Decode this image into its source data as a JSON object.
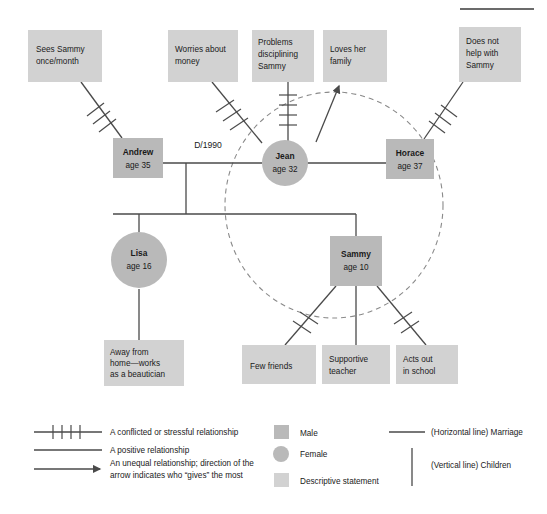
{
  "figure": {
    "title": "",
    "background_color": "#ffffff"
  },
  "colors": {
    "male_fill": "#b9b9b9",
    "female_fill": "#b9b9b9",
    "descriptive_fill": "#d2d2d2",
    "line": "#4a4a4a",
    "dashed_boundary": "#8a8a8a",
    "text": "#1a1a1a"
  },
  "people": [
    {
      "id": "andrew",
      "name": "Andrew",
      "age_label": "age 35",
      "gender": "male",
      "shape": "square"
    },
    {
      "id": "jean",
      "name": "Jean",
      "age_label": "age 32",
      "gender": "female",
      "shape": "circle"
    },
    {
      "id": "horace",
      "name": "Horace",
      "age_label": "age 37",
      "gender": "male",
      "shape": "square"
    },
    {
      "id": "lisa",
      "name": "Lisa",
      "age_label": "age 16",
      "gender": "female",
      "shape": "circle"
    },
    {
      "id": "sammy",
      "name": "Sammy",
      "age_label": "age 10",
      "gender": "male",
      "shape": "square"
    }
  ],
  "descriptive_statements": [
    {
      "id": "desc-sees-sammy",
      "lines": [
        "Sees Sammy",
        "once/month"
      ],
      "attached_to": "andrew",
      "relationship": "conflicted"
    },
    {
      "id": "desc-worries-money",
      "lines": [
        "Worries about",
        "money"
      ],
      "attached_to": "jean",
      "relationship": "conflicted"
    },
    {
      "id": "desc-discipline",
      "lines": [
        "Problems",
        "disciplining",
        "Sammy"
      ],
      "attached_to": "jean",
      "relationship": "conflicted"
    },
    {
      "id": "desc-loves-family",
      "lines": [
        "Loves her",
        "family"
      ],
      "attached_to": "jean",
      "relationship": "unequal-arrow"
    },
    {
      "id": "desc-no-help",
      "lines": [
        "Does not",
        "help with",
        "Sammy"
      ],
      "attached_to": "horace",
      "relationship": "conflicted"
    },
    {
      "id": "desc-beautician",
      "lines": [
        "Away from",
        "home—works",
        "as a beautician"
      ],
      "attached_to": "lisa",
      "relationship": "positive"
    },
    {
      "id": "desc-few-friends",
      "lines": [
        "Few friends"
      ],
      "attached_to": "sammy",
      "relationship": "conflicted"
    },
    {
      "id": "desc-supportive",
      "lines": [
        "Supportive",
        "teacher"
      ],
      "attached_to": "sammy",
      "relationship": "positive"
    },
    {
      "id": "desc-acts-out",
      "lines": [
        "Acts out",
        "in school"
      ],
      "attached_to": "sammy",
      "relationship": "conflicted"
    }
  ],
  "edge_labels": {
    "divorce": "D/1990"
  },
  "legend": {
    "relationships": [
      {
        "id": "legend-conflicted",
        "symbol": "hatched-line",
        "lines": [
          "A conflicted or stressful relationship"
        ]
      },
      {
        "id": "legend-positive",
        "symbol": "plain-line",
        "lines": [
          "A positive relationship"
        ]
      },
      {
        "id": "legend-unequal",
        "symbol": "arrow-line",
        "lines": [
          "An unequal relationship; direction of the",
          "arrow indicates who “gives” the most"
        ]
      }
    ],
    "shapes": [
      {
        "id": "legend-male",
        "symbol": "square",
        "label": "Male"
      },
      {
        "id": "legend-female",
        "symbol": "circle",
        "label": "Female"
      },
      {
        "id": "legend-descriptive",
        "symbol": "light-square",
        "label": "Descriptive statement"
      }
    ],
    "lines": [
      {
        "id": "legend-marriage",
        "symbol": "horizontal-line",
        "label": "(Horizontal line) Marriage"
      },
      {
        "id": "legend-children",
        "symbol": "vertical-line",
        "label": "(Vertical line) Children"
      }
    ]
  }
}
